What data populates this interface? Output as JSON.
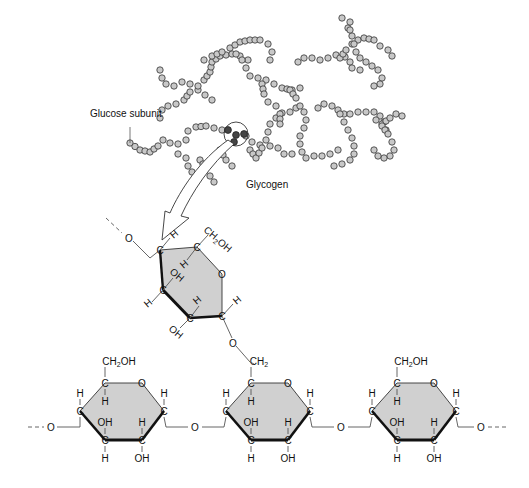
{
  "labels": {
    "glucose_subunit": "Glucose subunit",
    "glycogen": "Glycogen"
  },
  "atoms": {
    "C": "C",
    "O": "O",
    "H": "H",
    "OH": "OH",
    "CH2OH": "CH",
    "CH2OH_sub": "2",
    "CH2OH_tail": "OH",
    "CH2": "CH",
    "CH2_sub": "2"
  },
  "colors": {
    "ring_fill": "#d0d0d0",
    "bead_fill": "#c8c8c8",
    "highlight_bead": "#444444"
  }
}
